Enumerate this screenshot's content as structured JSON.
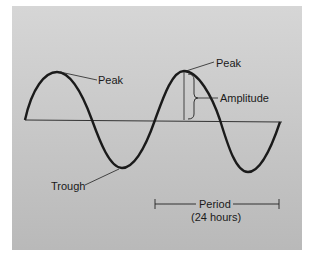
{
  "diagram": {
    "labels": {
      "peak_left": "Peak",
      "peak_right": "Peak",
      "amplitude": "Amplitude",
      "trough": "Trough",
      "period": "Period",
      "period_value": "(24 hours)"
    },
    "colors": {
      "background": "#c8c8c8",
      "wave": "#1a1a1a",
      "baseline": "#333333"
    }
  }
}
